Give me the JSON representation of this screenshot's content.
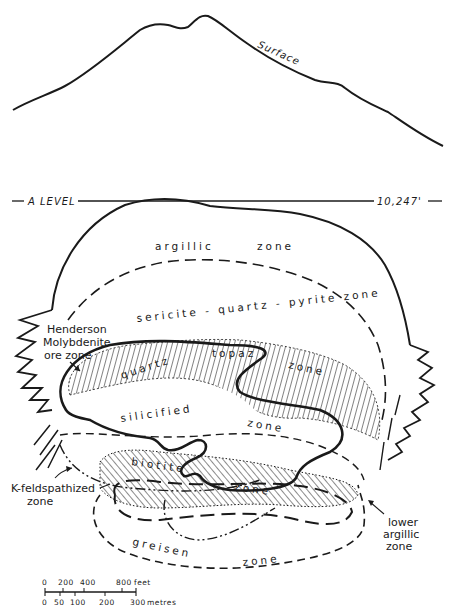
{
  "figure": {
    "type": "geological cross-section"
  },
  "surface": {
    "label": "Surface"
  },
  "level_line": {
    "left_label": "A LEVEL",
    "right_label": "10,247'"
  },
  "zones": {
    "argillic": {
      "word1": "argillic",
      "word2": "zone"
    },
    "sericite": {
      "label": "sericite - quartz - pyrite zone"
    },
    "quartz_topaz": {
      "word1": "quartz",
      "word2": "topaz",
      "word3": "zone"
    },
    "silicified": {
      "word1": "silicified",
      "word2": "zone"
    },
    "biotite": {
      "word1": "biotite",
      "word2": "zone"
    },
    "greisen": {
      "word1": "greisen",
      "word2": "zone"
    }
  },
  "callouts": {
    "ore_zone": {
      "line1": "Henderson",
      "line2": "Molybdenite",
      "line3": "ore zone"
    },
    "k_feldspathized": {
      "line1": "K-feldspathized",
      "line2": "zone"
    },
    "lower_argillic": {
      "line1": "lower",
      "line2": "argillic",
      "line3": "zone"
    }
  },
  "scale_bar": {
    "feet_ticks": [
      "0",
      "200",
      "400",
      "800"
    ],
    "feet_unit": "feet",
    "metre_ticks": [
      "0",
      "50",
      "100",
      "200",
      "300"
    ],
    "metre_unit": "metres"
  },
  "colors": {
    "ink": "#1a1a1a",
    "paper": "#ffffff"
  }
}
